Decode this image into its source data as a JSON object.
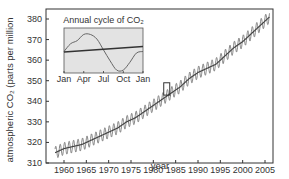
{
  "chart_data": {
    "type": "line",
    "title": "",
    "xlabel": "year",
    "ylabel": "atmospheric CO2 (parts per million",
    "ylabel_display": "atmospheric CO₂ (parts per million",
    "xlim": [
      1957,
      2007
    ],
    "ylim": [
      310,
      385
    ],
    "grid": false,
    "x_ticks": [
      1960,
      1965,
      1970,
      1975,
      1980,
      1985,
      1990,
      1995,
      2000,
      2005
    ],
    "y_ticks": [
      310,
      320,
      330,
      340,
      350,
      360,
      370,
      380
    ],
    "series": [
      {
        "name": "Monthly CO2 (seasonal)",
        "x": [
          1958,
          1960,
          1962,
          1964,
          1966,
          1968,
          1970,
          1972,
          1974,
          1976,
          1978,
          1980,
          1982,
          1984,
          1986,
          1988,
          1990,
          1992,
          1994,
          1996,
          1998,
          2000,
          2002,
          2004,
          2006
        ],
        "values": [
          315,
          317,
          318,
          319,
          321,
          323,
          325,
          327,
          330,
          332,
          335,
          338,
          341,
          344,
          347,
          351,
          354,
          356,
          358,
          362,
          366,
          369,
          373,
          377,
          381
        ],
        "seasonal_amplitude": 3
      },
      {
        "name": "Trend",
        "x": [
          1958,
          2006
        ],
        "values": [
          315,
          381
        ]
      }
    ],
    "highlight_box": {
      "x": 1983,
      "y_range": [
        343,
        349
      ]
    },
    "inset": {
      "title": "Annual cycle of CO2",
      "title_display": "Annual cycle of CO₂",
      "type": "line",
      "x_ticks": [
        "Jan",
        "Apr",
        "Jul",
        "Oct",
        "Jan"
      ],
      "series": [
        {
          "name": "Seasonal cycle",
          "x": [
            "Jan",
            "Feb",
            "Mar",
            "Apr",
            "May",
            "Jun",
            "Jul",
            "Aug",
            "Sep",
            "Oct",
            "Nov",
            "Dec",
            "Jan"
          ],
          "values": [
            0,
            2.5,
            3.5,
            5.5,
            5.5,
            4,
            0.5,
            -3,
            -6,
            -6,
            -3.5,
            -0.5,
            0
          ]
        },
        {
          "name": "Trend",
          "x": [
            "Jan",
            "Jan"
          ],
          "values": [
            0,
            1
          ]
        }
      ],
      "background": "#e3e3e3"
    }
  },
  "colors": {
    "line": "#555555",
    "axis": "#333333",
    "inset_bg": "#e3e3e3"
  }
}
